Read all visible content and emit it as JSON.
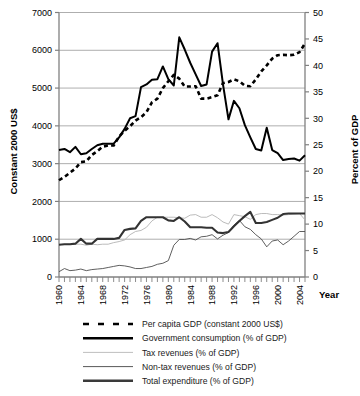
{
  "chart_data": {
    "type": "line",
    "title": "",
    "xlabel": "Year",
    "ylabel_left": "Constant 2000 US$",
    "ylabel_right": "Percent of GDP",
    "xlim": [
      1960,
      2005
    ],
    "ylim_left": [
      0,
      7000
    ],
    "ylim_right": [
      0,
      50
    ],
    "left_ticks": [
      0,
      1000,
      2000,
      3000,
      4000,
      5000,
      6000,
      7000
    ],
    "right_ticks": [
      0,
      5,
      10,
      15,
      20,
      25,
      30,
      35,
      40,
      45,
      50
    ],
    "x_ticks": [
      1960,
      1964,
      1968,
      1972,
      1976,
      1980,
      1984,
      1988,
      1992,
      1996,
      2000,
      2004
    ],
    "x_minor_step": 1,
    "grid": "horizontal-left-axis",
    "legend_position": "below",
    "x": [
      1960,
      1961,
      1962,
      1963,
      1964,
      1965,
      1966,
      1967,
      1968,
      1969,
      1970,
      1971,
      1972,
      1973,
      1974,
      1975,
      1976,
      1977,
      1978,
      1979,
      1980,
      1981,
      1982,
      1983,
      1984,
      1985,
      1986,
      1987,
      1988,
      1989,
      1990,
      1991,
      1992,
      1993,
      1994,
      1995,
      1996,
      1997,
      1998,
      1999,
      2000,
      2001,
      2002,
      2003,
      2004,
      2005
    ],
    "series": [
      {
        "name": "Per capita GDP (constant 2000 US$)",
        "axis": "left",
        "units": "Constant 2000 US$",
        "style": "dashed",
        "color": "#000000",
        "width": 2.6,
        "values": [
          2560,
          2650,
          2760,
          2870,
          3040,
          3060,
          3230,
          3330,
          3450,
          3480,
          3480,
          3720,
          3870,
          3990,
          4140,
          4230,
          4360,
          4620,
          4720,
          5000,
          5180,
          5350,
          5250,
          5040,
          5040,
          5050,
          4720,
          4720,
          4760,
          4810,
          5130,
          5160,
          5230,
          5180,
          5060,
          5050,
          5230,
          5440,
          5600,
          5780,
          5870,
          5880,
          5870,
          5880,
          5950,
          6180
        ]
      },
      {
        "name": "Government consumption (% of GDP)",
        "axis": "right",
        "units": "% of GDP",
        "style": "solid",
        "color": "#000000",
        "width": 2.0,
        "values": [
          24.0,
          24.2,
          23.6,
          24.6,
          23.2,
          23.4,
          24.2,
          24.9,
          25.2,
          25.2,
          25.2,
          26.4,
          28.0,
          30.0,
          30.4,
          35.9,
          36.4,
          37.3,
          37.4,
          39.8,
          37.4,
          36.2,
          45.3,
          43.0,
          40.5,
          38.3,
          36.1,
          36.4,
          42.6,
          44.2,
          36.4,
          29.8,
          33.3,
          31.9,
          28.7,
          26.4,
          24.2,
          23.9,
          28.2,
          24.0,
          23.4,
          22.1,
          22.3,
          22.4,
          22.0,
          23.0
        ]
      },
      {
        "name": "Tax revenues (% of GDP)",
        "axis": "right",
        "units": "% of GDP",
        "style": "solid",
        "color": "#b3b3b3",
        "width": 0.9,
        "values": [
          6.1,
          6.2,
          6.2,
          6.2,
          6.2,
          6.0,
          6.2,
          6.1,
          6.2,
          6.2,
          6.5,
          6.7,
          7.0,
          8.0,
          8.6,
          8.8,
          9.4,
          10.6,
          11.3,
          11.3,
          11.3,
          11.3,
          11.2,
          11.1,
          11.7,
          11.8,
          11.3,
          11.3,
          11.8,
          11.2,
          10.4,
          10.0,
          11.8,
          11.6,
          11.4,
          10.9,
          11.8,
          12.0,
          12.0,
          11.8,
          11.8,
          11.7,
          11.8,
          11.9,
          12.0,
          10.8
        ]
      },
      {
        "name": "Non-tax revenues (% of GDP)",
        "axis": "right",
        "units": "% of GDP",
        "style": "solid",
        "color": "#4d4d4d",
        "width": 0.9,
        "values": [
          1.0,
          1.6,
          1.2,
          1.3,
          1.5,
          1.2,
          1.4,
          1.5,
          1.6,
          1.8,
          2.0,
          2.2,
          2.1,
          1.9,
          1.6,
          1.6,
          1.8,
          2.0,
          2.4,
          2.6,
          3.1,
          6.0,
          7.1,
          7.1,
          7.3,
          7.0,
          7.6,
          7.7,
          8.0,
          7.2,
          7.9,
          8.4,
          9.8,
          10.7,
          9.5,
          9.0,
          8.0,
          7.2,
          5.7,
          6.8,
          7.0,
          6.1,
          6.8,
          7.7,
          8.6,
          8.6
        ]
      },
      {
        "name": "Total expenditure (% of GDP)",
        "axis": "right",
        "units": "% of GDP",
        "style": "solid",
        "color": "#333333",
        "width": 2.1,
        "values": [
          6.1,
          6.2,
          6.2,
          6.3,
          7.2,
          6.3,
          6.3,
          7.2,
          7.2,
          7.2,
          7.2,
          7.4,
          8.9,
          9.1,
          9.2,
          10.6,
          11.3,
          11.3,
          11.3,
          11.3,
          10.7,
          10.6,
          11.3,
          10.5,
          9.4,
          9.4,
          9.4,
          9.3,
          9.3,
          8.4,
          8.3,
          8.5,
          9.6,
          10.6,
          11.5,
          12.3,
          10.2,
          10.2,
          10.4,
          10.8,
          11.2,
          11.9,
          12.0,
          12.0,
          12.0,
          12.0
        ]
      }
    ],
    "legend": [
      {
        "label": "Per capita GDP (constant 2000 US$)",
        "style": "dashed",
        "color": "#000000",
        "width": 2.6
      },
      {
        "label": "Government consumption (% of GDP)",
        "style": "solid",
        "color": "#000000",
        "width": 2.4
      },
      {
        "label": "Tax revenues (% of GDP)",
        "style": "solid",
        "color": "#bfbfbf",
        "width": 1.0
      },
      {
        "label": "Non-tax revenues (% of GDP)",
        "style": "solid",
        "color": "#595959",
        "width": 1.0
      },
      {
        "label": "Total expenditure (% of GDP)",
        "style": "solid",
        "color": "#3a3a3a",
        "width": 2.4
      }
    ]
  },
  "colors": {
    "grid": "#999999",
    "axis": "#808080",
    "text": "#000000"
  }
}
